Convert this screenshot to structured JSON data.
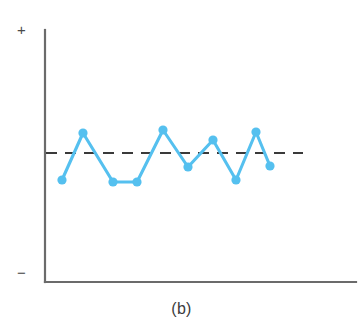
{
  "figure": {
    "caption": "(b)",
    "axis_labels": {
      "positive": "+",
      "negative": "−"
    },
    "colors": {
      "series": "#55c0ef",
      "axis": "#6b6b6b",
      "reference_line": "#3a3a3a",
      "background": "#ffffff",
      "text": "#3c3c3c"
    }
  },
  "chart_data": {
    "type": "line",
    "title": "(b)",
    "subtitle": "",
    "xlabel": "",
    "ylabel": "",
    "grid": false,
    "legend": null,
    "axis_ranges": {
      "x": [
        0,
        13
      ],
      "y": [
        -1,
        1
      ]
    },
    "axis_tick_labels": {
      "y": [
        "+",
        "−"
      ],
      "x": []
    },
    "annotations": [
      {
        "kind": "reference-line",
        "style": "dashed",
        "orientation": "horizontal",
        "value": 0,
        "label": ""
      }
    ],
    "series": [
      {
        "name": "residuals",
        "marker": "circle",
        "x": [
          0,
          1,
          2,
          3,
          4,
          5,
          6,
          7,
          8,
          9,
          10,
          11
        ],
        "values": [
          -0.4,
          0.34,
          -0.42,
          -0.42,
          0.39,
          -0.15,
          0.15,
          -0.38,
          0.36,
          -0.12,
          null,
          null
        ]
      }
    ],
    "points_px": [
      {
        "x": 62,
        "y": 180
      },
      {
        "x": 83,
        "y": 133
      },
      {
        "x": 113,
        "y": 182
      },
      {
        "x": 137,
        "y": 182
      },
      {
        "x": 163,
        "y": 130
      },
      {
        "x": 188,
        "y": 167
      },
      {
        "x": 213,
        "y": 140
      },
      {
        "x": 236,
        "y": 180
      },
      {
        "x": 256,
        "y": 132
      },
      {
        "x": 270,
        "y": 166
      }
    ],
    "reference_line_px": {
      "y": 153,
      "x_start": 46,
      "x_end": 303
    },
    "axes_px": {
      "y_axis": {
        "x": 45,
        "y_top": 30,
        "y_bottom": 282
      },
      "x_axis": {
        "y": 282,
        "x_start": 45,
        "x_end": 356
      }
    }
  }
}
